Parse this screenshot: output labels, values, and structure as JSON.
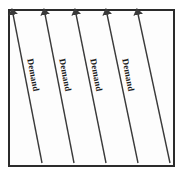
{
  "figure": {
    "title": "",
    "background_color": "#ffffff",
    "frame": {
      "stroke_color": "#2b2b2b",
      "fill_color": "#fdfdfd",
      "stroke_width": 2,
      "x": 8,
      "y": 9,
      "width": 167,
      "height": 158
    }
  },
  "chart_data": {
    "type": "line",
    "title": "",
    "xlabel": "",
    "ylabel": "",
    "grid": false,
    "legend": "none",
    "arrow_color": "#3a3a3a",
    "arrow_count": 5,
    "label_count": 4,
    "arrows": [
      {
        "id": "arrow-1",
        "tail_x": 42,
        "tail_y": 163,
        "head_x": 13,
        "head_y": 14,
        "label": "Demand"
      },
      {
        "id": "arrow-2",
        "tail_x": 74,
        "tail_y": 163,
        "head_x": 45,
        "head_y": 14,
        "label": "Demand"
      },
      {
        "id": "arrow-3",
        "tail_x": 106,
        "tail_y": 163,
        "head_x": 76,
        "head_y": 14,
        "label": "Demand"
      },
      {
        "id": "arrow-4",
        "tail_x": 138,
        "tail_y": 163,
        "head_x": 107,
        "head_y": 14,
        "label": "Demand"
      },
      {
        "id": "arrow-5",
        "tail_x": 170,
        "tail_y": 163,
        "head_x": 138,
        "head_y": 14,
        "label": ""
      }
    ],
    "labels": [
      {
        "text": "Demand",
        "x": 34,
        "y": 58,
        "rotation_deg": 79
      },
      {
        "text": "Demand",
        "x": 66,
        "y": 58,
        "rotation_deg": 79
      },
      {
        "text": "Demand",
        "x": 97,
        "y": 58,
        "rotation_deg": 79
      },
      {
        "text": "Demand",
        "x": 129,
        "y": 58,
        "rotation_deg": 79
      }
    ]
  }
}
